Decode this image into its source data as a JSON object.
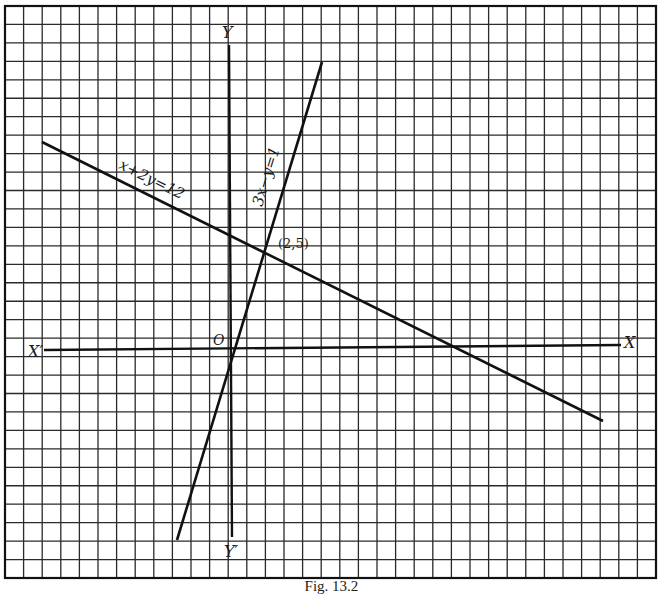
{
  "figure": {
    "caption": "Fig. 13.2",
    "grid": {
      "columns": 35,
      "rows": 31,
      "unit_px": 18.5
    },
    "axes": {
      "x_label": "X",
      "x_neg_label": "X′",
      "y_label": "Y",
      "y_neg_label": "Y′",
      "origin_label": "O"
    },
    "lines": [
      {
        "equation": "x+2y=12",
        "label": "x+2y=12"
      },
      {
        "equation": "3x-y=1",
        "label": "3x−y=1"
      }
    ],
    "intersection": {
      "label": "(2,5)",
      "x": 2,
      "y": 5
    }
  },
  "chart_data": {
    "type": "line",
    "title": "",
    "xlabel": "X",
    "ylabel": "Y",
    "xlim": [
      -10,
      21
    ],
    "ylim": [
      -10,
      18
    ],
    "grid": true,
    "series": [
      {
        "name": "x+2y=12",
        "points": [
          [
            -10,
            11
          ],
          [
            20,
            -4
          ]
        ]
      },
      {
        "name": "3x-y=1",
        "points": [
          [
            -3,
            -10
          ],
          [
            5,
            14
          ]
        ]
      }
    ],
    "annotations": [
      {
        "text": "(2,5)",
        "x": 2,
        "y": 5
      },
      {
        "text": "O",
        "x": 0,
        "y": 0
      }
    ]
  }
}
